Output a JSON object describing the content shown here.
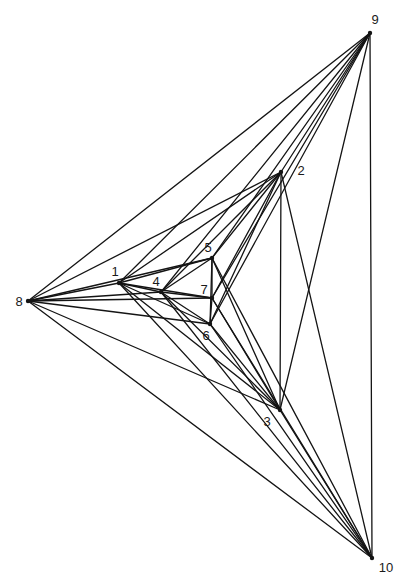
{
  "figure": {
    "background": "#ffffff",
    "edge_color": "#141414",
    "edge_width": 1.3,
    "node_color": "#141414",
    "node_radius": 2.2,
    "label_color": "#1a1a1a"
  },
  "chart_data": {
    "type": "node-link-graph",
    "nodes": [
      {
        "id": "1",
        "label": "1",
        "x": 119,
        "y": 283,
        "label_dx": -4,
        "label_dy": -12
      },
      {
        "id": "2",
        "label": "2",
        "x": 281,
        "y": 172,
        "label_dx": 20,
        "label_dy": -2
      },
      {
        "id": "3",
        "label": "3",
        "x": 280,
        "y": 410,
        "label_dx": -13,
        "label_dy": 11
      },
      {
        "id": "4",
        "label": "4",
        "x": 161,
        "y": 292,
        "label_dx": -5,
        "label_dy": -11
      },
      {
        "id": "5",
        "label": "5",
        "x": 212,
        "y": 258,
        "label_dx": -4,
        "label_dy": -11
      },
      {
        "id": "6",
        "label": "6",
        "x": 210,
        "y": 324,
        "label_dx": -4,
        "label_dy": 11
      },
      {
        "id": "7",
        "label": "7",
        "x": 212,
        "y": 298,
        "label_dx": -8,
        "label_dy": -9
      },
      {
        "id": "8",
        "label": "8",
        "x": 28,
        "y": 301,
        "label_dx": -9,
        "label_dy": 0
      },
      {
        "id": "9",
        "label": "9",
        "x": 370,
        "y": 33,
        "label_dx": 5,
        "label_dy": -14
      },
      {
        "id": "10",
        "label": "10",
        "x": 372,
        "y": 558,
        "label_dx": 14,
        "label_dy": 9
      }
    ],
    "edges": [
      [
        "1",
        "2"
      ],
      [
        "1",
        "3"
      ],
      [
        "1",
        "4"
      ],
      [
        "1",
        "5"
      ],
      [
        "1",
        "6"
      ],
      [
        "1",
        "7"
      ],
      [
        "1",
        "8"
      ],
      [
        "1",
        "9"
      ],
      [
        "1",
        "10"
      ],
      [
        "2",
        "3"
      ],
      [
        "2",
        "4"
      ],
      [
        "2",
        "5"
      ],
      [
        "2",
        "6"
      ],
      [
        "2",
        "7"
      ],
      [
        "2",
        "8"
      ],
      [
        "2",
        "9"
      ],
      [
        "2",
        "10"
      ],
      [
        "3",
        "4"
      ],
      [
        "3",
        "5"
      ],
      [
        "3",
        "6"
      ],
      [
        "3",
        "7"
      ],
      [
        "3",
        "8"
      ],
      [
        "3",
        "9"
      ],
      [
        "3",
        "10"
      ],
      [
        "4",
        "5"
      ],
      [
        "4",
        "6"
      ],
      [
        "4",
        "7"
      ],
      [
        "4",
        "8"
      ],
      [
        "4",
        "9"
      ],
      [
        "4",
        "10"
      ],
      [
        "5",
        "6"
      ],
      [
        "5",
        "7"
      ],
      [
        "5",
        "8"
      ],
      [
        "5",
        "9"
      ],
      [
        "5",
        "10"
      ],
      [
        "6",
        "7"
      ],
      [
        "6",
        "8"
      ],
      [
        "6",
        "9"
      ],
      [
        "6",
        "10"
      ],
      [
        "7",
        "8"
      ],
      [
        "7",
        "9"
      ],
      [
        "7",
        "10"
      ],
      [
        "8",
        "9"
      ],
      [
        "8",
        "10"
      ],
      [
        "9",
        "10"
      ]
    ]
  }
}
